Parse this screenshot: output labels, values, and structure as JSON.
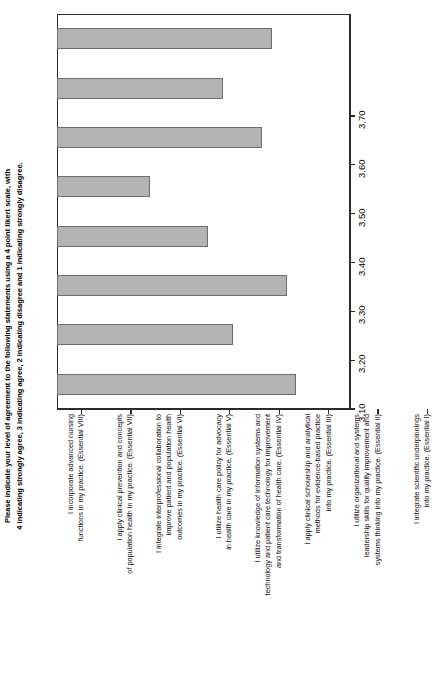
{
  "chart_data": {
    "type": "bar",
    "orientation": "horizontal-rotated",
    "title": "Please indicate your level of agreement to the following statements using a 4 point likert scale, with\n4 indicating strongly agree, 3 indicating agree, 2 indicating disagree and 1 indicating strongly disagree.",
    "xlabel": "",
    "ylabel": "",
    "grid": false,
    "legend": "none",
    "ylim": [
      3.1,
      3.7
    ],
    "tick_labels": [
      "3.10",
      "3.20",
      "3.30",
      "3.40",
      "3.50",
      "3.60",
      "3.70"
    ],
    "tick_values": [
      3.1,
      3.2,
      3.3,
      3.4,
      3.5,
      3.6,
      3.7
    ],
    "categories": [
      "I incorporate advanced nursing\nfunctions in my practice. (Essential VIII)",
      "I apply clinical prevention and concepts\nof population health in my practice. (Essential VII)",
      "I integrate interprofessional collaboration to\nimprove patient and population health\noutcomes in my practice. (Essential VI)",
      "I utilize health care policy for advocacy\nin health care in my practice. (Essential V)",
      "I utilize knowledge of information systems and\ntechnology and patient care technology for improvement\nand transformation of health care. (Essential IV)",
      "I apply clinical scholarship and analytical\nmethods for evidence-based practice\ninto my practice. (Essential III)",
      "I utilize organizational and systems\nleadership skills for quality improvement and\nsystems thinking into my practice. (Essential II)",
      "I integrate scientific underpinnings\ninto my practice. (Essential I)"
    ],
    "values": [
      3.54,
      3.44,
      3.52,
      3.29,
      3.41,
      3.57,
      3.46,
      3.59
    ],
    "bar_color": "#b3b3b3",
    "bar_edge_color": "#6e6e6e",
    "axis_color": "#2b2b2b",
    "background": "#ffffff"
  }
}
